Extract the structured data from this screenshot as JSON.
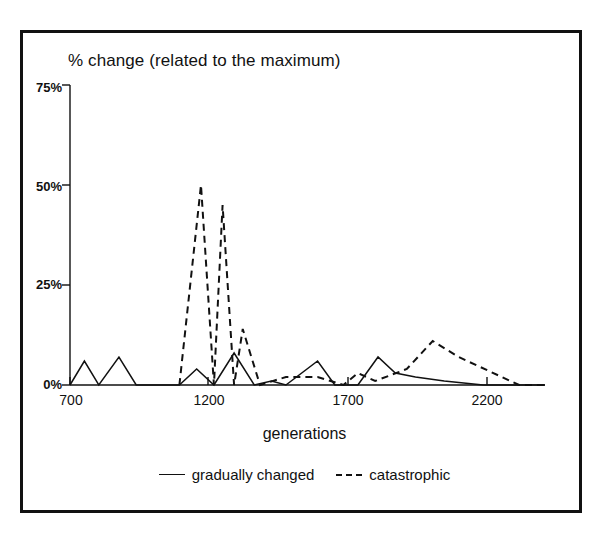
{
  "chart_data": {
    "type": "line",
    "title": "% change (related to the maximum)",
    "xlabel": "generations",
    "ylabel": "",
    "xlim": [
      700,
      2350
    ],
    "ylim": [
      0,
      75
    ],
    "grid": false,
    "legend_position": "bottom",
    "xticks": [
      700,
      1200,
      1700,
      2200
    ],
    "xtick_labels": [
      "700",
      "1200",
      "1700",
      "2200"
    ],
    "yticks": [
      0,
      25,
      50,
      75
    ],
    "ytick_labels": [
      "0%",
      "25%",
      "50%",
      "75%"
    ],
    "series": [
      {
        "name": "gradually changed",
        "style": "solid",
        "color": "#111111",
        "points": [
          [
            700,
            0
          ],
          [
            750,
            6
          ],
          [
            800,
            0
          ],
          [
            870,
            7
          ],
          [
            930,
            0
          ],
          [
            1080,
            0
          ],
          [
            1140,
            4
          ],
          [
            1200,
            0
          ],
          [
            1270,
            8
          ],
          [
            1340,
            0
          ],
          [
            1400,
            1
          ],
          [
            1450,
            0
          ],
          [
            1560,
            6
          ],
          [
            1620,
            0
          ],
          [
            1700,
            0
          ],
          [
            1770,
            7
          ],
          [
            1830,
            3
          ],
          [
            1900,
            2
          ],
          [
            2000,
            1
          ],
          [
            2135,
            0
          ],
          [
            2350,
            0
          ]
        ]
      },
      {
        "name": "catastrophic",
        "style": "dashed",
        "color": "#111111",
        "points": [
          [
            1080,
            0
          ],
          [
            1155,
            50
          ],
          [
            1200,
            0
          ],
          [
            1230,
            45
          ],
          [
            1270,
            0
          ],
          [
            1300,
            14
          ],
          [
            1360,
            0
          ],
          [
            1450,
            2
          ],
          [
            1560,
            2
          ],
          [
            1650,
            0
          ],
          [
            1700,
            3
          ],
          [
            1760,
            1
          ],
          [
            1870,
            4
          ],
          [
            1960,
            11
          ],
          [
            2050,
            7
          ],
          [
            2260,
            0
          ],
          [
            2350,
            0
          ]
        ]
      }
    ]
  },
  "chart": {
    "title": "% change (related to the maximum)",
    "xlabel": "generations",
    "yticks": {
      "t75": "75%",
      "t50": "50%",
      "t25": "25%",
      "t0": "0%"
    },
    "xticks": {
      "t700": "700",
      "t1200": "1200",
      "t1700": "1700",
      "t2200": "2200"
    },
    "legend": [
      {
        "label": "gradually changed",
        "style": "solid"
      },
      {
        "label": "catastrophic",
        "style": "dashed"
      }
    ],
    "colors": {
      "ink": "#111111",
      "background": "#ffffff"
    }
  }
}
